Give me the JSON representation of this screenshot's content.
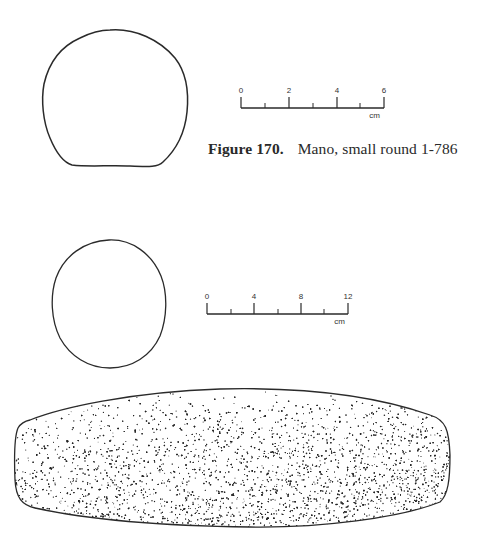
{
  "figure_170": {
    "caption_number": "Figure 170.",
    "caption_text": "Mano, small round 1-786",
    "scale": {
      "ticks": [
        "0",
        "2",
        "4",
        "6"
      ],
      "unit": "cm"
    },
    "outline_shape": "rounded-square-section"
  },
  "figure_171": {
    "scale": {
      "ticks": [
        "0",
        "4",
        "8",
        "12"
      ],
      "unit": "cm"
    },
    "cross_section_shape": "oval",
    "side_view_shape": "elongated-stippled-mano"
  },
  "colors": {
    "background": "#ffffff",
    "ink": "#2a2a2a"
  }
}
